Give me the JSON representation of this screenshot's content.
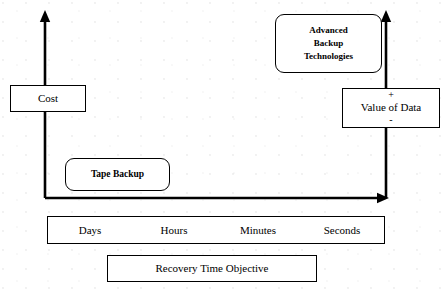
{
  "diagram": {
    "title_text": "",
    "background_color": "#ffffff",
    "stroke_color": "#000000",
    "axes": {
      "left_axis": {
        "name": "cost-axis",
        "arrow_direction": "up",
        "x": 45,
        "y_top": 12,
        "y_bottom": 198
      },
      "right_axis": {
        "name": "value-axis",
        "arrow_direction": "up",
        "x": 386,
        "y_top": 12,
        "y_bottom": 198
      },
      "bottom_axis": {
        "name": "time-axis",
        "arrow_direction": "right",
        "y": 198,
        "x_left": 45,
        "x_right": 388
      }
    },
    "nodes": {
      "cost": {
        "label": "Cost",
        "shape": "rectangle"
      },
      "value_of_data": {
        "plus": "+",
        "label": "Value of Data",
        "minus": "-",
        "shape": "rectangle"
      },
      "advanced_backup": {
        "line1": "Advanced",
        "line2": "Backup",
        "line3": "Technologies",
        "shape": "rounded-rectangle"
      },
      "tape_backup": {
        "label": "Tape Backup",
        "shape": "rounded-rectangle"
      },
      "recovery_time_objective": {
        "label": "Recovery Time Objective",
        "shape": "rectangle"
      }
    },
    "time_scale": {
      "labels": [
        {
          "label": "Days"
        },
        {
          "label": "Hours"
        },
        {
          "label": "Minutes"
        },
        {
          "label": "Seconds"
        }
      ]
    }
  }
}
